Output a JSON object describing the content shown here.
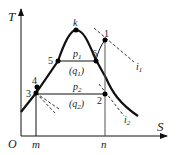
{
  "diagram": {
    "type": "T-S diagram (vapor compression refrigeration cycle)",
    "axes": {
      "y_label": "T",
      "x_label": "S",
      "origin_label": "O"
    },
    "points": [
      {
        "id": "k",
        "label": "k"
      },
      {
        "id": "1",
        "label": "1"
      },
      {
        "id": "2",
        "label": "2"
      },
      {
        "id": "3",
        "label": "3"
      },
      {
        "id": "4",
        "label": "4"
      },
      {
        "id": "5",
        "label": "5"
      },
      {
        "id": "6",
        "label": "6"
      }
    ],
    "isobars": [
      {
        "name": "p1",
        "label_main": "p",
        "label_sub": "1",
        "heat_main": "(q",
        "heat_sub": "1",
        "heat_close": ")"
      },
      {
        "name": "p2",
        "label_main": "p",
        "label_sub": "2",
        "heat_main": "(q",
        "heat_sub": "2",
        "heat_close": ")"
      }
    ],
    "isenthalps": [
      {
        "name": "i1",
        "label_main": "i",
        "label_sub": "1"
      },
      {
        "name": "i2",
        "label_main": "i",
        "label_sub": "2"
      }
    ],
    "x_ticks": [
      {
        "label": "m"
      },
      {
        "label": "n"
      }
    ],
    "line_color": "#111111",
    "dash_color": "#333333",
    "point_color": "#000000"
  }
}
